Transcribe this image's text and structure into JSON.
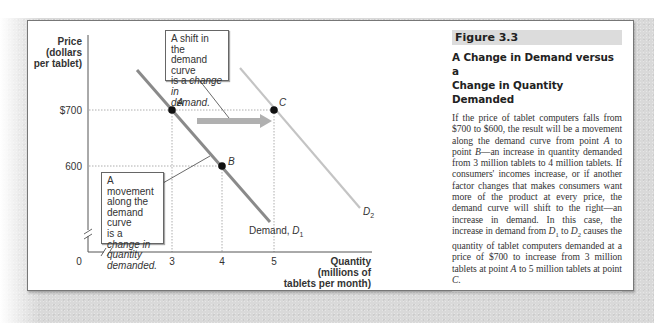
{
  "figure": {
    "tag": "Figure 3.3",
    "title_line1": "A Change in Demand versus a",
    "title_line2": "Change in Quantity Demanded",
    "body_segments": [
      {
        "t": "If the price of tablet computers falls from $700 to $600, the result will be a movement along the demand curve from point "
      },
      {
        "t": "A",
        "i": true
      },
      {
        "t": " to point "
      },
      {
        "t": "B",
        "i": true
      },
      {
        "t": "—an increase in quantity demanded from 3 million tablets to 4 million tablets. If consumers' incomes increase, or if another factor changes that makes consumers want more of the product at every price, the demand curve will shift to the right—an increase in demand. In this case, the increase in demand from "
      },
      {
        "t": "D",
        "i": true
      },
      {
        "t": "1",
        "sub": true
      },
      {
        "t": " to "
      },
      {
        "t": "D",
        "i": true
      },
      {
        "t": "2",
        "sub": true
      },
      {
        "t": " causes the quantity of tablet computers demanded at a price of $700 to increase from 3 million tablets at point "
      },
      {
        "t": "A",
        "i": true
      },
      {
        "t": " to 5 million tablets at point "
      },
      {
        "t": "C",
        "i": true
      },
      {
        "t": "."
      }
    ]
  },
  "callouts": {
    "shift": {
      "line1": "A shift in the",
      "line2": "demand curve",
      "line3_plain": "is a ",
      "line3_ital": "change in",
      "line4_ital": "demand."
    },
    "movement": {
      "line1": "A movement",
      "line2": "along the",
      "line3": "demand curve",
      "line4_plain": "is a ",
      "line4_ital": "change in",
      "line5_ital": "quantity",
      "line6_ital": "demanded."
    }
  },
  "axes": {
    "y_label": [
      "Price",
      "(dollars",
      "per tablet)"
    ],
    "x_label": [
      "Quantity",
      "(millions of",
      "tablets per month)"
    ],
    "origin": "0",
    "y_ticks": [
      "$700",
      "600"
    ],
    "x_ticks": [
      "3",
      "4",
      "5"
    ]
  },
  "labels": {
    "d1_prefix": "Demand, ",
    "d1_letter": "D",
    "d1_sub": "1",
    "d2_letter": "D",
    "d2_sub": "2",
    "point_a": "A",
    "point_b": "B",
    "point_c": "C"
  },
  "colors": {
    "d1": "#8a8a8a",
    "d2": "#c4c4c4",
    "arrow": "#b0b0b0",
    "point": "#111111",
    "fig_tag_bg": "#dcdcdc"
  },
  "chart_data": {
    "type": "line",
    "title": "A Change in Demand versus a Change in Quantity Demanded",
    "xlabel": "Quantity (millions of tablets per month)",
    "ylabel": "Price (dollars per tablet)",
    "x_ticks": [
      0,
      3,
      4,
      5
    ],
    "y_ticks": [
      600,
      700
    ],
    "axis_breaks": [
      "x",
      "y"
    ],
    "grid": false,
    "series": [
      {
        "name": "Demand, D1",
        "points": [
          {
            "label": "A",
            "x": 3,
            "y": 700
          },
          {
            "label": "B",
            "x": 4,
            "y": 600
          }
        ]
      },
      {
        "name": "D2",
        "points": [
          {
            "label": "C",
            "x": 5,
            "y": 700
          }
        ]
      }
    ],
    "annotations": [
      "A shift in the demand curve is a change in demand.",
      "A movement along the demand curve is a change in quantity demanded.",
      "Arrow from D1 to D2 at price $700"
    ]
  }
}
